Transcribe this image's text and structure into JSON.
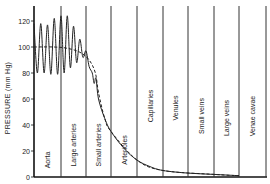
{
  "chart_data": {
    "type": "line",
    "title": "",
    "xlabel": "",
    "ylabel": "PRESSURE (mm Hg)",
    "ylim": [
      0,
      130
    ],
    "yticks": [
      0,
      20,
      40,
      60,
      80,
      100,
      120
    ],
    "grid": false,
    "legend": "none",
    "regions": [
      "Aorta",
      "Large arteries",
      "Small arteries",
      "Arterioles",
      "Capillaries",
      "Venules",
      "Small veins",
      "Large veins",
      "Venae cavae"
    ],
    "series": [
      {
        "name": "Pulsatile pressure",
        "style": "solid",
        "description": "Oscillates between ~80 and ~120 mmHg in aorta, amplitude grows in large arteries (up to ~125), then damps in small arteries and arterioles, falling to ~35 at start of capillaries and approaching ~0 at venae cavae",
        "points": [
          [
            0,
            118
          ],
          [
            0.5,
            80
          ],
          [
            1,
            118
          ],
          [
            1.5,
            80
          ],
          [
            2,
            117
          ],
          [
            2.5,
            79
          ],
          [
            3,
            122
          ],
          [
            3.5,
            79
          ],
          [
            4,
            124
          ],
          [
            4.5,
            80
          ],
          [
            5,
            124
          ],
          [
            5.5,
            84
          ],
          [
            6,
            116
          ],
          [
            6.5,
            88
          ],
          [
            7,
            106
          ],
          [
            7.5,
            92
          ],
          [
            8,
            97
          ],
          [
            8.5,
            85
          ],
          [
            9,
            80
          ],
          [
            9.3,
            72
          ],
          [
            9.6,
            76
          ],
          [
            10,
            60
          ],
          [
            11,
            45
          ],
          [
            12,
            35
          ],
          [
            14,
            22
          ],
          [
            16,
            13
          ],
          [
            18,
            8
          ],
          [
            20,
            5
          ],
          [
            24,
            3
          ],
          [
            28,
            2
          ],
          [
            32,
            1
          ]
        ]
      },
      {
        "name": "Mean pressure",
        "style": "dashed",
        "points": [
          [
            0,
            100
          ],
          [
            3,
            100
          ],
          [
            5,
            99
          ],
          [
            7,
            96
          ],
          [
            8.5,
            90
          ],
          [
            9.5,
            80
          ],
          [
            10,
            65
          ],
          [
            11,
            45
          ],
          [
            12,
            35
          ],
          [
            16,
            13
          ],
          [
            20,
            5
          ],
          [
            28,
            2
          ],
          [
            32,
            1
          ]
        ]
      }
    ]
  }
}
